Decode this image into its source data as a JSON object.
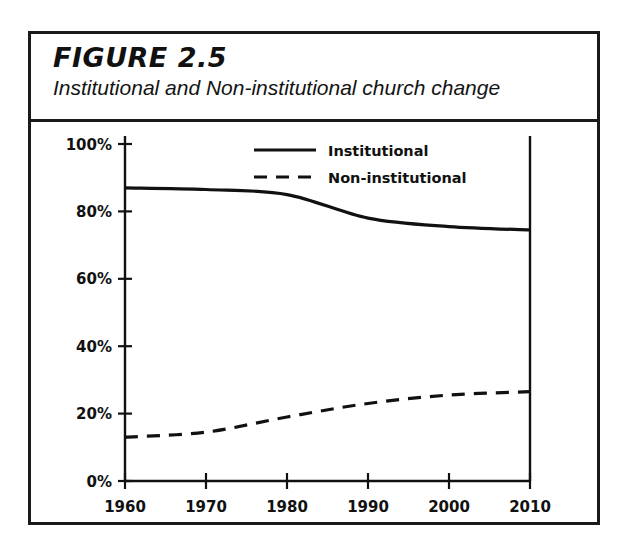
{
  "figure": {
    "number_label": "FIGURE 2.5",
    "subtitle": "Institutional and Non-institutional church change"
  },
  "chart_data": {
    "type": "line",
    "title": "Institutional and Non-institutional church change",
    "xlabel": "",
    "ylabel": "",
    "x": [
      1960,
      1970,
      1980,
      1990,
      2000,
      2010
    ],
    "xlim": [
      1960,
      2010
    ],
    "ylim": [
      0,
      100
    ],
    "xticks": [
      1960,
      1970,
      1980,
      1990,
      2000,
      2010
    ],
    "xtick_labels": [
      "1960",
      "1970",
      "1980",
      "1990",
      "2000",
      "2010"
    ],
    "yticks": [
      0,
      20,
      40,
      60,
      80,
      100
    ],
    "ytick_labels": [
      "0%",
      "20%",
      "40%",
      "60%",
      "80%",
      "100%"
    ],
    "grid": false,
    "legend_position": "top-right",
    "series": [
      {
        "name": "Institutional",
        "style": "solid",
        "color": "#111111",
        "values": [
          87,
          86.5,
          85,
          78,
          75.5,
          74.5
        ]
      },
      {
        "name": "Non-institutional",
        "style": "dashed",
        "color": "#111111",
        "values": [
          13,
          14.5,
          19,
          23,
          25.5,
          26.5
        ]
      }
    ]
  },
  "legend": {
    "entries": [
      {
        "label": "Institutional",
        "style": "solid"
      },
      {
        "label": "Non-institutional",
        "style": "dashed"
      }
    ]
  }
}
